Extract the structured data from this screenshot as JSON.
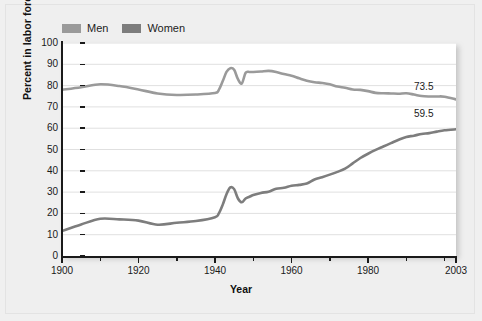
{
  "chart_data": {
    "type": "line",
    "title": "",
    "xlabel": "Year",
    "ylabel": "Percent in labor force",
    "xlim": [
      1900,
      2003
    ],
    "ylim": [
      0,
      100
    ],
    "grid": true,
    "legend_position": "top-left",
    "y_ticks": [
      100,
      90,
      80,
      70,
      60,
      50,
      40,
      30,
      20,
      10,
      0
    ],
    "x_ticks": [
      1900,
      1910,
      1920,
      1930,
      1940,
      1950,
      1960,
      1970,
      1980,
      1990,
      2000
    ],
    "x_tick_labels": [
      "1900",
      "",
      "1920",
      "",
      "1940",
      "",
      "1960",
      "",
      "1980",
      "",
      ""
    ],
    "x_major_labels": [
      {
        "year": 1900,
        "label": "1900"
      },
      {
        "year": 1920,
        "label": "1920"
      },
      {
        "year": 1940,
        "label": "1940"
      },
      {
        "year": 1960,
        "label": "1960"
      },
      {
        "year": 1980,
        "label": "1980"
      },
      {
        "year": 2003,
        "label": "2003"
      }
    ],
    "colors": {
      "men": "#9a9a9a",
      "women": "#7d7d7d",
      "gridline": "#e0e0e0",
      "axis": "#1a1a1a",
      "panel_background": "#ffffff",
      "figure_background": "#efefef"
    },
    "series": [
      {
        "name": "Men",
        "color": "#9a9a9a",
        "end_label": "73.5",
        "x": [
          1900,
          1905,
          1910,
          1915,
          1920,
          1925,
          1930,
          1935,
          1940,
          1941,
          1942,
          1943,
          1944,
          1945,
          1946,
          1947,
          1948,
          1949,
          1950,
          1952,
          1954,
          1956,
          1958,
          1960,
          1962,
          1964,
          1966,
          1968,
          1970,
          1972,
          1974,
          1976,
          1978,
          1980,
          1982,
          1984,
          1986,
          1988,
          1990,
          1992,
          1994,
          1996,
          1998,
          2000,
          2003
        ],
        "y": [
          78.0,
          79.2,
          80.6,
          79.8,
          78.2,
          76.3,
          75.6,
          75.8,
          76.5,
          78.0,
          82.0,
          86.4,
          88.2,
          87.4,
          83.0,
          81.0,
          86.0,
          86.4,
          86.4,
          86.6,
          86.9,
          86.4,
          85.4,
          84.6,
          83.4,
          82.3,
          81.6,
          81.2,
          80.6,
          79.6,
          79.0,
          78.2,
          78.0,
          77.4,
          76.6,
          76.4,
          76.3,
          76.2,
          76.4,
          75.8,
          75.1,
          74.9,
          74.9,
          74.8,
          73.5
        ]
      },
      {
        "name": "Women",
        "color": "#7d7d7d",
        "end_label": "59.5",
        "x": [
          1900,
          1905,
          1910,
          1915,
          1920,
          1925,
          1930,
          1935,
          1940,
          1941,
          1942,
          1943,
          1944,
          1945,
          1946,
          1947,
          1948,
          1949,
          1950,
          1952,
          1954,
          1956,
          1958,
          1960,
          1962,
          1964,
          1966,
          1968,
          1970,
          1972,
          1974,
          1976,
          1978,
          1980,
          1982,
          1984,
          1986,
          1988,
          1990,
          1992,
          1994,
          1996,
          1998,
          2000,
          2003
        ],
        "y": [
          11.7,
          14.8,
          17.5,
          17.2,
          16.6,
          14.7,
          15.6,
          16.4,
          18.2,
          20.0,
          24.0,
          29.0,
          32.2,
          31.4,
          27.0,
          25.2,
          27.0,
          27.8,
          28.6,
          29.6,
          30.2,
          31.6,
          32.0,
          33.0,
          33.4,
          34.0,
          35.9,
          37.0,
          38.2,
          39.5,
          41.0,
          43.5,
          46.0,
          48.0,
          49.8,
          51.4,
          53.0,
          54.6,
          55.9,
          56.5,
          57.3,
          57.7,
          58.4,
          59.0,
          59.5
        ]
      }
    ]
  },
  "legend": {
    "entries": [
      {
        "label": "Men",
        "color": "#9a9a9a"
      },
      {
        "label": "Women",
        "color": "#7d7d7d"
      }
    ]
  },
  "axes": {
    "y_title": "Percent in labor force",
    "x_title": "Year"
  }
}
